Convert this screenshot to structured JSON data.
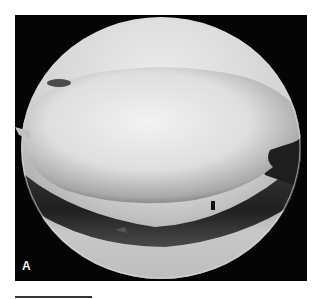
{
  "figure": {
    "panel_label": "A",
    "image_description": "arthroscopic circular endoscopic view, grayscale",
    "colors": {
      "background": "#ffffff",
      "frame": "#050505",
      "tissue_light": "#e8e8e8",
      "tissue_mid": "#a8a8a8",
      "tissue_dark": "#2a2a2a",
      "scale_bar": "#333333"
    },
    "scale_bar": {
      "visible": true
    }
  }
}
